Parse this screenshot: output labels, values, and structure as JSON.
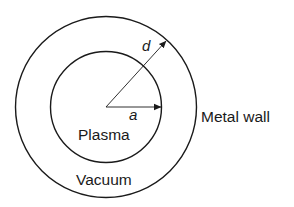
{
  "diagram": {
    "labels": {
      "plasma": "Plasma",
      "vacuum": "Vacuum",
      "metal_wall": "Metal wall",
      "inner_radius": "a",
      "outer_radius": "d"
    },
    "colors": {
      "stroke": "#1a1a1a",
      "background": "#ffffff"
    }
  }
}
